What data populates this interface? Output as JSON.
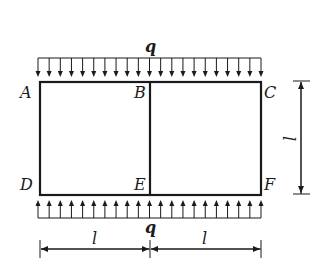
{
  "diagram": {
    "type": "structural-frame",
    "nodes": {
      "A": "A",
      "B": "B",
      "C": "C",
      "D": "D",
      "E": "E",
      "F": "F"
    },
    "loads": {
      "top": {
        "label": "q",
        "direction": "down",
        "arrow_count": 21
      },
      "bottom": {
        "label": "q",
        "direction": "up",
        "arrow_count": 21
      }
    },
    "dimensions": {
      "left_span": "l",
      "right_span": "l",
      "height": "l"
    },
    "colors": {
      "stroke": "#1a1a1a",
      "background": "#ffffff"
    }
  }
}
